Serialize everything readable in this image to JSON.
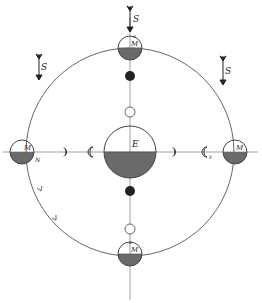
{
  "diagram": {
    "type": "tidal-orbit-diagram",
    "colors": {
      "ink": "#333333",
      "line": "#777777",
      "shade": "#6a6a6a",
      "background": "#ffffff"
    },
    "earth": {
      "label": "E"
    },
    "moons": [
      {
        "position": "top",
        "label": "M",
        "sublabel": "a"
      },
      {
        "position": "left",
        "label": "M",
        "sublabel": "N"
      },
      {
        "position": "right",
        "label": "M",
        "sublabel": ""
      },
      {
        "position": "bottom",
        "label": "M",
        "sublabel": "a"
      }
    ],
    "sun_arrows": [
      {
        "position": "top-center",
        "label": "S"
      },
      {
        "position": "top-left",
        "label": "S"
      },
      {
        "position": "top-right",
        "label": "S"
      }
    ],
    "crescent_labels": {
      "right_inner": "y"
    }
  }
}
